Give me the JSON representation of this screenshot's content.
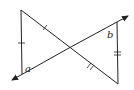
{
  "diagram": {
    "type": "geometry-two-triangles-vertical-angles",
    "labels": {
      "angle_a": "a",
      "angle_b": "b"
    },
    "stroke_color": "#222222",
    "background": "#ffffff",
    "tick_marks": {
      "left_vertical_side": "single",
      "upper_left_diagonal": "single",
      "right_vertical_side": "double",
      "lower_right_diagonal": "double"
    }
  }
}
